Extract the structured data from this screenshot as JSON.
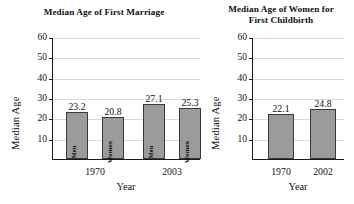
{
  "charts": [
    {
      "title": "Median Age of First Marriage",
      "title_lines": [
        "Median Age of First Marriage"
      ],
      "ylabel": "Median Age",
      "xlabel": "Year",
      "yticks": [
        "60",
        "50",
        "40",
        "30",
        "20",
        "10"
      ],
      "groups": [
        "1970",
        "2003"
      ],
      "bars": [
        {
          "value_label": "23.2",
          "inner_label": "Men"
        },
        {
          "value_label": "20.8",
          "inner_label": "Women"
        },
        {
          "value_label": "27.1",
          "inner_label": "Men"
        },
        {
          "value_label": "25.3",
          "inner_label": "Women"
        }
      ]
    },
    {
      "title": "Median Age of Women for First Childbirth",
      "title_lines": [
        "Median Age of Women for",
        "First Childbirth"
      ],
      "ylabel": "Median Age",
      "xlabel": "Year",
      "yticks": [
        "60",
        "50",
        "40",
        "30",
        "20",
        "10"
      ],
      "groups": [
        "1970",
        "2002"
      ],
      "bars": [
        {
          "value_label": "22.1",
          "inner_label": ""
        },
        {
          "value_label": "24.8",
          "inner_label": ""
        }
      ]
    }
  ],
  "colors": {
    "bar_fill": "#9b9b9b",
    "bar_stroke": "#3a3a3a",
    "axis": "#1a1a1a",
    "gridline": "#d9d9d9",
    "background": "#ffffff"
  },
  "chart_data": [
    {
      "type": "bar",
      "title": "Median Age of First Marriage",
      "xlabel": "Year",
      "ylabel": "Median Age",
      "ylim": [
        0,
        60
      ],
      "yticks": [
        10,
        20,
        30,
        40,
        50,
        60
      ],
      "grid": true,
      "legend": "none",
      "categories": [
        "1970",
        "2003"
      ],
      "series": [
        {
          "name": "Men",
          "values": [
            23.2,
            27.1
          ]
        },
        {
          "name": "Women",
          "values": [
            20.8,
            25.3
          ]
        }
      ],
      "data_labels": [
        "23.2",
        "20.8",
        "27.1",
        "25.3"
      ]
    },
    {
      "type": "bar",
      "title": "Median Age of Women for First Childbirth",
      "xlabel": "Year",
      "ylabel": "Median Age",
      "ylim": [
        0,
        60
      ],
      "yticks": [
        10,
        20,
        30,
        40,
        50,
        60
      ],
      "grid": true,
      "legend": "none",
      "categories": [
        "1970",
        "2002"
      ],
      "values": [
        22.1,
        24.8
      ],
      "data_labels": [
        "22.1",
        "24.8"
      ]
    }
  ]
}
